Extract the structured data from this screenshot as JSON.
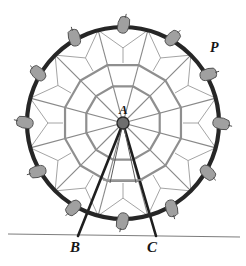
{
  "figure": {
    "kind": "ferris-wheel-geometry-diagram",
    "background_color": "#ffffff",
    "width": 246,
    "height": 266
  },
  "labels": [
    {
      "id": "A",
      "text": "A",
      "role": "wheel-center-label",
      "x": 125,
      "y": 110
    },
    {
      "id": "P",
      "text": "P",
      "role": "rim-point-label",
      "x": 215,
      "y": 48
    },
    {
      "id": "B",
      "text": "B",
      "role": "ground-support-label-left",
      "x": 76,
      "y": 248
    },
    {
      "id": "C",
      "text": "C",
      "role": "ground-support-label-right",
      "x": 153,
      "y": 248
    }
  ],
  "geometry": {
    "center": {
      "x": 123,
      "y": 123
    },
    "outer_rim_radius": 96,
    "middle_ring_radius": 60,
    "inner_ring_radius": 38,
    "hub_radius": 6,
    "spoke_count": 12,
    "gondola_count": 12,
    "polygon_sides": 12,
    "rim_start_angle_deg": -75,
    "ground_line": {
      "x1": 8,
      "y1": 234,
      "x2": 240,
      "y2": 237
    },
    "support_left_foot": {
      "x": 78,
      "y": 236
    },
    "support_right_foot": {
      "x": 156,
      "y": 236
    },
    "point_P": {
      "x": 203,
      "y": 58
    }
  },
  "colors": {
    "rim": "#262626",
    "spoke": "#8a8a8a",
    "ring": "#8f8f8f",
    "strut": "#9a9a9a",
    "gondola_fill": "#a0a0a0",
    "gondola_stroke": "#4a4a4a",
    "support_leg": "#1f1f1f",
    "ground": "#7d7d7d",
    "hub_fill": "#6e6e6e",
    "hub_stroke": "#2b2b2b",
    "label": "#151515"
  },
  "strokes": {
    "rim_width": 4.2,
    "spoke_width": 1.1,
    "ring_width": 2.2,
    "strut_width": 0.9,
    "support_leg_width": 2.6,
    "ground_width": 1.1
  }
}
